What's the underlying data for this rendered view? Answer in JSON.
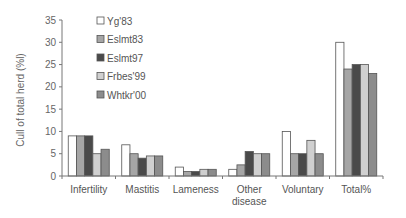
{
  "chart_data": {
    "type": "bar",
    "title": "",
    "xlabel": "",
    "ylabel": "Cull of total herd (%l)",
    "ylim": [
      0,
      35
    ],
    "yticks": [
      0,
      5,
      10,
      15,
      20,
      25,
      30,
      35
    ],
    "grid": false,
    "legend_position": "upper-left-inside",
    "categories": [
      "Infertility",
      "Mastitis",
      "Lameness",
      "Other disease",
      "Voluntary",
      "Total%"
    ],
    "category_lines": [
      [
        "Infertility"
      ],
      [
        "Mastitis"
      ],
      [
        "Lameness"
      ],
      [
        "Other",
        "disease"
      ],
      [
        "Voluntary"
      ],
      [
        "Total%"
      ]
    ],
    "series": [
      {
        "name": "Yg'83",
        "color": "#ffffff",
        "values": [
          9,
          7,
          2,
          1.5,
          10,
          30
        ]
      },
      {
        "name": "Eslmt83",
        "color": "#a6a6a6",
        "values": [
          9,
          5,
          1,
          2.5,
          5,
          24
        ]
      },
      {
        "name": "Eslmt97",
        "color": "#4a4a4a",
        "values": [
          9,
          4,
          1,
          5.5,
          5,
          25
        ]
      },
      {
        "name": "Frbes'99",
        "color": "#d0d0d0",
        "values": [
          5,
          4.5,
          1.5,
          5,
          8,
          25
        ]
      },
      {
        "name": "Whtkr'00",
        "color": "#8c8c8c",
        "values": [
          6,
          4.5,
          1.5,
          5,
          5,
          23
        ]
      }
    ]
  }
}
